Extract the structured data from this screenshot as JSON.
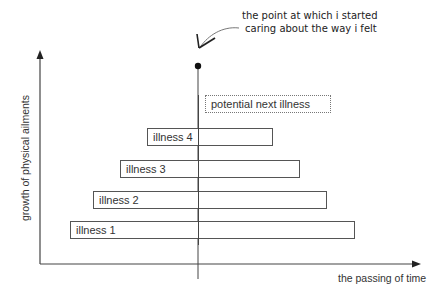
{
  "diagram": {
    "x_axis_label": "the passing of time",
    "y_axis_label": "growth of physical ailments",
    "annotation": {
      "line1": "the point at which i started",
      "line2": "caring about the way i felt"
    },
    "bars": [
      {
        "label": "illness 4",
        "left": 147,
        "top": 128,
        "right": 273,
        "bottom": 146,
        "style": "solid"
      },
      {
        "label": "illness 3",
        "left": 120,
        "top": 160,
        "right": 300,
        "bottom": 178,
        "style": "solid"
      },
      {
        "label": "illness 2",
        "left": 93,
        "top": 191,
        "right": 327,
        "bottom": 209,
        "style": "solid"
      },
      {
        "label": "illness 1",
        "left": 70,
        "top": 221,
        "right": 355,
        "bottom": 239,
        "style": "solid"
      },
      {
        "label": "potential next illness",
        "left": 205,
        "top": 95,
        "right": 331,
        "bottom": 112,
        "style": "dotted"
      }
    ],
    "colors": {
      "axis": "#444444",
      "bar_border": "#555555",
      "text": "#333333",
      "background": "#ffffff"
    }
  }
}
